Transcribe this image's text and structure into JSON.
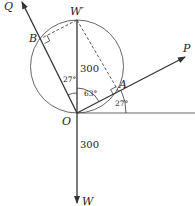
{
  "diagram": {
    "points": {
      "O": {
        "label": "O",
        "x": 77,
        "y": 113
      },
      "W_prime": {
        "label": "W′",
        "x": 77,
        "y": 20
      },
      "W": {
        "label": "W",
        "x": 77,
        "y": 203
      },
      "A": {
        "label": "A",
        "x": 119,
        "y": 92
      },
      "B": {
        "label": "B",
        "x": 42,
        "y": 38
      },
      "P": {
        "label": "P",
        "x": 185,
        "y": 57
      },
      "Q": {
        "label": "Q",
        "x": 22,
        "y": 2
      }
    },
    "circle": {
      "cx": 77,
      "cy": 66.5,
      "r": 46.5
    },
    "magnitudes": {
      "upper": "300",
      "lower": "300"
    },
    "angles": {
      "between_Q_and_vertical": "27°",
      "between_vertical_and_P": "63°",
      "between_P_and_horizontal": "27°"
    },
    "colors": {
      "stroke": "#333333",
      "text": "#222222"
    }
  }
}
